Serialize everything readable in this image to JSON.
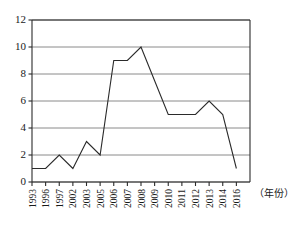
{
  "chart_data": {
    "type": "line",
    "title": "",
    "subtitle": "",
    "xlabel": "（年份）",
    "ylabel": "",
    "categories": [
      "1993",
      "1996",
      "1997",
      "2002",
      "2003",
      "2005",
      "2006",
      "2007",
      "2008",
      "2009",
      "2010",
      "2011",
      "2012",
      "2013",
      "2014",
      "2016"
    ],
    "values": [
      1,
      1,
      2,
      1,
      3,
      2,
      9,
      9,
      10,
      7.5,
      5,
      5,
      5,
      6,
      5,
      1
    ],
    "series": [
      {
        "name": "count",
        "values": [
          1,
          1,
          2,
          1,
          3,
          2,
          9,
          9,
          10,
          7.5,
          5,
          5,
          5,
          6,
          5,
          1
        ]
      }
    ],
    "yticks": [
      0,
      2,
      4,
      6,
      8,
      10,
      12
    ],
    "ytick_labels": [
      "0",
      "2",
      "4",
      "6",
      "8",
      "10",
      "12"
    ],
    "ylim": [
      0,
      12
    ],
    "xtick_labels": [
      "1993",
      "1996",
      "1997",
      "2002",
      "2003",
      "2005",
      "2006",
      "2007",
      "2008",
      "2009",
      "2010",
      "2011",
      "2012",
      "2013",
      "2014",
      "2016"
    ],
    "grid": true,
    "grid_axis": "y",
    "legend": false,
    "legend_position": "none",
    "markers": false,
    "annotations": [],
    "colors": {
      "line": "#2b2b2b",
      "grid": "#8a8a8a",
      "axis": "#2b2b2b",
      "background": "#ffffff",
      "text": "#1a1a1a"
    }
  },
  "axis_caption": {
    "x_unit": "（年份）"
  }
}
